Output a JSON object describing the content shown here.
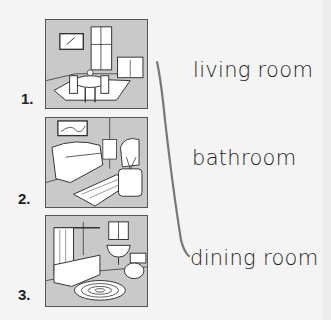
{
  "exercise": {
    "pictures": [
      {
        "number": "1.",
        "scene": "dining room illustration"
      },
      {
        "number": "2.",
        "scene": "living room illustration"
      },
      {
        "number": "3.",
        "scene": "bathroom illustration"
      }
    ],
    "words": [
      "living room",
      "bathroom",
      "dining room"
    ],
    "matches_drawn": [
      {
        "from_word": "living room",
        "to_word": "dining room",
        "line_color": "#777777"
      }
    ]
  },
  "colors": {
    "background": "#f4f4f4",
    "picture_fill": "#c9c9c9",
    "line_art": "#333333",
    "text": "#1c1c1c"
  }
}
